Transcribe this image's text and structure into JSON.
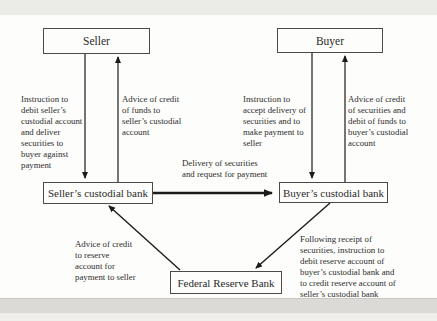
{
  "nodes": {
    "seller": "Seller",
    "buyer": "Buyer",
    "sellers_custodial_bank": "Seller’s custodial bank",
    "buyers_custodial_bank": "Buyer’s custodial bank",
    "federal_reserve_bank": "Federal Reserve Bank"
  },
  "labels": {
    "instruction_debit_seller": "Instruction to debit seller’s custodial account and deliver securities to buyer against payment",
    "advice_credit_funds_seller": "Advice of credit of funds to seller’s custodial account",
    "instruction_accept_delivery": "Instruction to accept delivery of securities and to make payment to seller",
    "advice_credit_securities_buyer": "Advice of credit of securities and debit of funds to buyer’s custodial account",
    "delivery_request_payment": "Delivery of securities and request for payment",
    "advice_credit_reserve": "Advice of credit to reserve account for payment to seller",
    "following_receipt": "Following receipt of securities, instruction to debit reserve account of buyer’s custodial bank and to credit reserve account of seller’s custodial bank"
  },
  "colors": {
    "line": "#1b1b1b",
    "box_border": "#4a4a4a",
    "text": "#2e2e2e",
    "background": "#fdfdfb"
  }
}
